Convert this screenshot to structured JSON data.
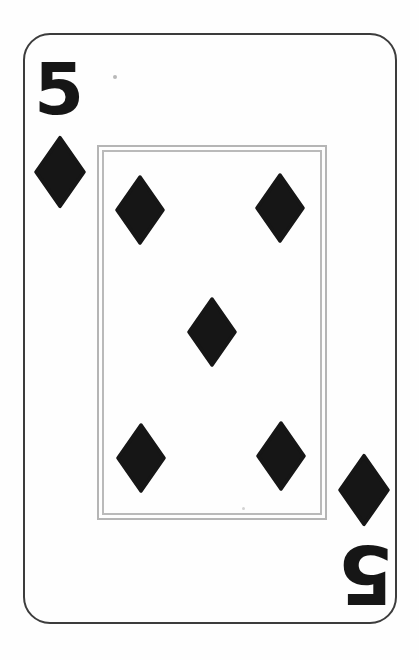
{
  "card": {
    "rank": "5",
    "suit": "diamonds",
    "suit_symbol": "♦",
    "pip_count": 5,
    "pip_arrangement": "2-1-2",
    "index_top_left": {
      "rank": "5"
    },
    "index_bottom_right": {
      "rank": "5",
      "rotated_180": true
    },
    "colors": {
      "ink": "#161616",
      "card_background": "#fefefe",
      "card_border": "#3c3c3c",
      "inner_frame": "#b5b5b5"
    }
  }
}
